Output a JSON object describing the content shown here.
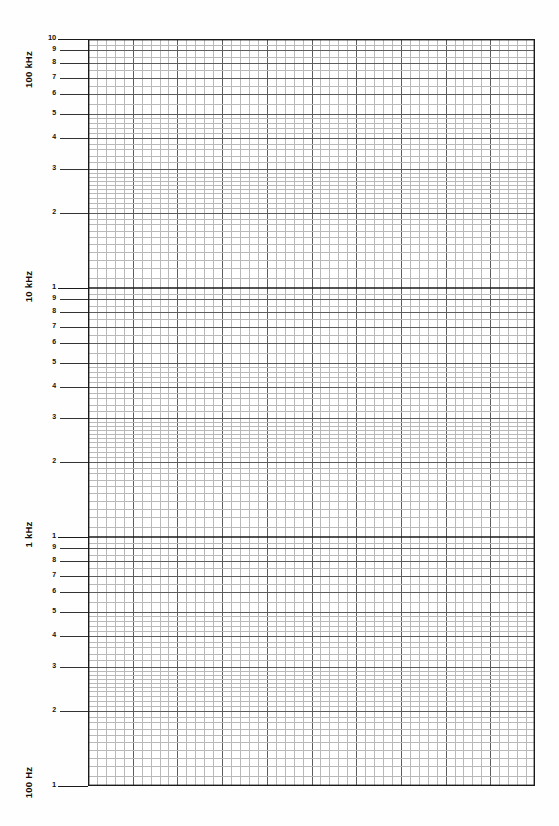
{
  "document": {
    "title": "Semi-logarithmic graph paper",
    "sheet_color": "#fefefe",
    "grid_color_minor": "#b9b9b9",
    "grid_color_major": "#5d5d5d",
    "grid_color_decade": "#1a1a1a",
    "axis_color": "#111111",
    "width": 559,
    "height": 826
  },
  "chart_data": {
    "type": "line",
    "title": "",
    "subtitle": "",
    "xlabel": "",
    "ylabel": "",
    "series": [],
    "grid": "on",
    "legend_position": "none",
    "x_axis": {
      "scale": "linear",
      "minor_divisions": 50,
      "major_every": 5,
      "tick_labels": [],
      "range_px": [
        88,
        535
      ]
    },
    "y_axis": {
      "scale": "log",
      "orientation": "inverted",
      "decades": 3,
      "range": [
        100,
        100000
      ],
      "unit_captions": [
        "100 kHz",
        "10 kHz",
        "1 kHz",
        "100 Hz"
      ],
      "mantissa_ticks": [
        10,
        9,
        8,
        7,
        6,
        5,
        4,
        3,
        2,
        1
      ]
    }
  },
  "axis": {
    "decades": [
      {
        "caption": "100 kHz",
        "caption_y": 72,
        "ticks": [
          {
            "label": "10",
            "value": 10,
            "major": true
          },
          {
            "label": "9",
            "value": 9,
            "major": false
          },
          {
            "label": "8",
            "value": 8,
            "major": false
          },
          {
            "label": "7",
            "value": 7,
            "major": false
          },
          {
            "label": "6",
            "value": 6,
            "major": false
          },
          {
            "label": "5",
            "value": 5,
            "major": false
          },
          {
            "label": "4",
            "value": 4,
            "major": false
          },
          {
            "label": "3",
            "value": 3,
            "major": false
          },
          {
            "label": "2",
            "value": 2,
            "major": false
          }
        ]
      },
      {
        "caption": "10 kHz",
        "caption_y": 289,
        "ticks": [
          {
            "label": "1",
            "value": 10,
            "major": true
          },
          {
            "label": "9",
            "value": 9,
            "major": false
          },
          {
            "label": "8",
            "value": 8,
            "major": false
          },
          {
            "label": "7",
            "value": 7,
            "major": false
          },
          {
            "label": "6",
            "value": 6,
            "major": false
          },
          {
            "label": "5",
            "value": 5,
            "major": false
          },
          {
            "label": "4",
            "value": 4,
            "major": false
          },
          {
            "label": "3",
            "value": 3,
            "major": false
          },
          {
            "label": "2",
            "value": 2,
            "major": false
          }
        ]
      },
      {
        "caption": "1 kHz",
        "caption_y": 537,
        "ticks": [
          {
            "label": "1",
            "value": 10,
            "major": true
          },
          {
            "label": "9",
            "value": 9,
            "major": false
          },
          {
            "label": "8",
            "value": 8,
            "major": false
          },
          {
            "label": "7",
            "value": 7,
            "major": false
          },
          {
            "label": "6",
            "value": 6,
            "major": false
          },
          {
            "label": "5",
            "value": 5,
            "major": false
          },
          {
            "label": "4",
            "value": 4,
            "major": false
          },
          {
            "label": "3",
            "value": 3,
            "major": false
          },
          {
            "label": "2",
            "value": 2,
            "major": false
          }
        ]
      },
      {
        "caption": "100 Hz",
        "caption_y": 785,
        "ticks": [
          {
            "label": "1",
            "value": 10,
            "major": true
          }
        ]
      }
    ]
  }
}
